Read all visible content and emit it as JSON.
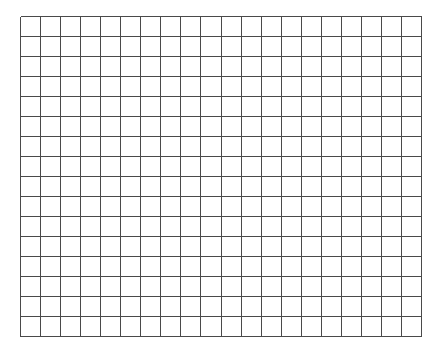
{
  "grid": {
    "columns": 20,
    "rows": 16,
    "cell_width": 20.05,
    "cell_height": 20,
    "line_color": "#4a4a4a",
    "background": "#ffffff"
  }
}
